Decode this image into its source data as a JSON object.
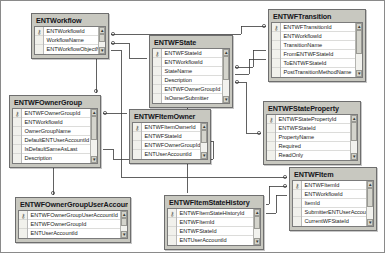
{
  "diagram": {
    "kind": "database-er-diagram",
    "colors": {
      "canvas_background": "#ffffff",
      "entity_header": "#c8c8c0",
      "entity_body": "#ffffff",
      "border": "#6e6e6e",
      "connector": "#3a3a3a"
    },
    "scrollbar": {
      "up_arrow": "▲",
      "down_arrow": "▼"
    },
    "primary_key_glyph": "⚷",
    "entities": [
      {
        "id": "entworkflow",
        "title": "ENTWorkflow",
        "x": 30,
        "y": 12,
        "width": 78,
        "columns": [
          {
            "name": "ENTWorkflowId",
            "key": true
          },
          {
            "name": "WorkflowName",
            "key": false
          },
          {
            "name": "ENTWorkflowObjectName",
            "key": false
          }
        ]
      },
      {
        "id": "entwfstate",
        "title": "ENTWFState",
        "x": 148,
        "y": 34,
        "width": 84,
        "columns": [
          {
            "name": "ENTWFStateId",
            "key": true
          },
          {
            "name": "ENTWorkflowId",
            "key": false
          },
          {
            "name": "StateName",
            "key": false
          },
          {
            "name": "Description",
            "key": false
          },
          {
            "name": "ENTWFOwnerGroupId",
            "key": false
          },
          {
            "name": "IsOwnerSubmitter",
            "key": false
          }
        ]
      },
      {
        "id": "entwftransition",
        "title": "ENTWFTransition",
        "x": 267,
        "y": 8,
        "width": 98,
        "columns": [
          {
            "name": "ENTWFTransitionId",
            "key": true
          },
          {
            "name": "ENTWorkflowId",
            "key": false
          },
          {
            "name": "TransitionName",
            "key": false
          },
          {
            "name": "FromENTWFStateId",
            "key": false
          },
          {
            "name": "ToENTWFStateId",
            "key": false
          },
          {
            "name": "PostTransitionMethodName",
            "key": false
          }
        ]
      },
      {
        "id": "entwfownergroup",
        "title": "ENTWFOwnerGroup",
        "x": 8,
        "y": 94,
        "width": 92,
        "columns": [
          {
            "name": "ENTWFOwnerGroupId",
            "key": true
          },
          {
            "name": "ENTWorkflowId",
            "key": false
          },
          {
            "name": "OwnerGroupName",
            "key": false
          },
          {
            "name": "DefaultENTUserAccountId",
            "key": false
          },
          {
            "name": "IsDefaultSameAsLast",
            "key": false
          },
          {
            "name": "Description",
            "key": false
          }
        ]
      },
      {
        "id": "entwfitemowner",
        "title": "ENTWFItemOwner",
        "x": 128,
        "y": 108,
        "width": 82,
        "columns": [
          {
            "name": "ENTWFItemOwnerId",
            "key": true
          },
          {
            "name": "ENTWFStateId",
            "key": false
          },
          {
            "name": "ENTWFOwnerGroupId",
            "key": false
          },
          {
            "name": "ENTUserAccountId",
            "key": false
          }
        ]
      },
      {
        "id": "entwfstateproperty",
        "title": "ENTWFStateProperty",
        "x": 262,
        "y": 100,
        "width": 98,
        "columns": [
          {
            "name": "ENTWFStatePropertyId",
            "key": true
          },
          {
            "name": "ENTWFStateId",
            "key": false
          },
          {
            "name": "PropertyName",
            "key": false
          },
          {
            "name": "Required",
            "key": false
          },
          {
            "name": "ReadOnly",
            "key": false
          }
        ]
      },
      {
        "id": "entwfownergroupuseraccount",
        "title": "ENTWFOwnerGroupUserAccount",
        "x": 14,
        "y": 196,
        "width": 116,
        "columns": [
          {
            "name": "ENTWFOwnerGroupUserAccountId",
            "key": true
          },
          {
            "name": "ENTWFOwnerGroupId",
            "key": false
          },
          {
            "name": "ENTUserAccountId",
            "key": false
          }
        ]
      },
      {
        "id": "entwfitemstatehistory",
        "title": "ENTWFItemStateHistory",
        "x": 163,
        "y": 194,
        "width": 100,
        "columns": [
          {
            "name": "ENTWFItemStateHistoryId",
            "key": true
          },
          {
            "name": "ENTWFItemId",
            "key": false
          },
          {
            "name": "ENTWFStateId",
            "key": false
          },
          {
            "name": "ENTUserAccountId",
            "key": false
          }
        ]
      },
      {
        "id": "entwfitem",
        "title": "ENTWFItem",
        "x": 288,
        "y": 166,
        "width": 88,
        "columns": [
          {
            "name": "ENTWFItemId",
            "key": true
          },
          {
            "name": "ENTWorkflowId",
            "key": false
          },
          {
            "name": "ItemId",
            "key": false
          },
          {
            "name": "SubmitterENTUserAccountId",
            "key": false
          },
          {
            "name": "CurrentWFStateId",
            "key": false
          }
        ]
      }
    ],
    "relationships": [
      {
        "from": "entworkflow",
        "to": "entwftransition",
        "name": "fk-workflow-transition"
      },
      {
        "from": "entworkflow",
        "to": "entwfstate",
        "name": "fk-workflow-state"
      },
      {
        "from": "entworkflow",
        "to": "entwfownergroup",
        "name": "fk-workflow-ownergroup"
      },
      {
        "from": "entworkflow",
        "to": "entwfitem",
        "name": "fk-workflow-item"
      },
      {
        "from": "entwfstate",
        "to": "entwftransition",
        "name": "fk-state-transition"
      },
      {
        "from": "entwfstate",
        "to": "entwfstateproperty",
        "name": "fk-state-stateproperty"
      },
      {
        "from": "entwfstate",
        "to": "entwfitemowner",
        "name": "fk-state-itemowner"
      },
      {
        "from": "entwfstate",
        "to": "entwfitemstatehistory",
        "name": "fk-state-itemstatehistory"
      },
      {
        "from": "entwfownergroup",
        "to": "entwfitemowner",
        "name": "fk-ownergroup-itemowner"
      },
      {
        "from": "entwfownergroup",
        "to": "entwfownergroupuseraccount",
        "name": "fk-ownergroup-useraccount"
      },
      {
        "from": "entwfitem",
        "to": "entwfitemstatehistory",
        "name": "fk-item-itemstatehistory"
      }
    ]
  }
}
